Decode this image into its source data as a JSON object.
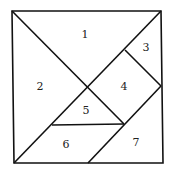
{
  "diagram": {
    "type": "tangram",
    "pieces": [
      {
        "id": "1",
        "label": "1",
        "x": 85,
        "y": 38
      },
      {
        "id": "2",
        "label": "2",
        "x": 40,
        "y": 90
      },
      {
        "id": "3",
        "label": "3",
        "x": 146,
        "y": 51
      },
      {
        "id": "4",
        "label": "4",
        "x": 124,
        "y": 90
      },
      {
        "id": "5",
        "label": "5",
        "x": 86,
        "y": 114
      },
      {
        "id": "6",
        "label": "6",
        "x": 66,
        "y": 148
      },
      {
        "id": "7",
        "label": "7",
        "x": 136,
        "y": 146
      }
    ]
  }
}
